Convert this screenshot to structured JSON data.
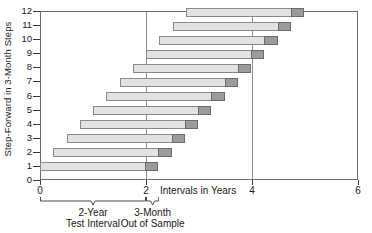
{
  "chart_data": {
    "type": "bar",
    "orientation": "horizontal",
    "title": "",
    "xlabel": "Intervals in Years",
    "ylabel": "Step-Forward in 3-Month Steps",
    "xlim": [
      0,
      6
    ],
    "ylim": [
      0,
      12
    ],
    "xticks": [
      0,
      2,
      4,
      6
    ],
    "xticklabels": [
      "0",
      "2",
      "4",
      "6"
    ],
    "yticks": [
      0,
      1,
      2,
      3,
      4,
      5,
      6,
      7,
      8,
      9,
      10,
      11,
      12
    ],
    "yticklabels": [
      "0",
      "1",
      "2",
      "3",
      "4",
      "5",
      "6",
      "7",
      "8",
      "9",
      "10",
      "11",
      "12"
    ],
    "grid": "vertical-only",
    "gridlines_x": [
      2,
      4
    ],
    "legend": "none",
    "series": [
      {
        "name": "2-Year Test Interval",
        "color": "#e2e2e2",
        "edge_color": "#8a8a8a",
        "length_years": 2.0
      },
      {
        "name": "3-Month Out of Sample",
        "color": "#9b9b9b",
        "edge_color": "#6b6b6b",
        "length_years": 0.25
      }
    ],
    "categories": [
      "1",
      "2",
      "3",
      "4",
      "5",
      "6",
      "7",
      "8",
      "9",
      "10",
      "11",
      "12"
    ],
    "bars": [
      {
        "step": 1,
        "start": 0.0,
        "test_end": 2.0,
        "oos_end": 2.25
      },
      {
        "step": 2,
        "start": 0.25,
        "test_end": 2.25,
        "oos_end": 2.5
      },
      {
        "step": 3,
        "start": 0.5,
        "test_end": 2.5,
        "oos_end": 2.75
      },
      {
        "step": 4,
        "start": 0.75,
        "test_end": 2.75,
        "oos_end": 3.0
      },
      {
        "step": 5,
        "start": 1.0,
        "test_end": 3.0,
        "oos_end": 3.25
      },
      {
        "step": 6,
        "start": 1.25,
        "test_end": 3.25,
        "oos_end": 3.5
      },
      {
        "step": 7,
        "start": 1.5,
        "test_end": 3.5,
        "oos_end": 3.75
      },
      {
        "step": 8,
        "start": 1.75,
        "test_end": 3.75,
        "oos_end": 4.0
      },
      {
        "step": 9,
        "start": 2.0,
        "test_end": 4.0,
        "oos_end": 4.25
      },
      {
        "step": 10,
        "start": 2.25,
        "test_end": 4.25,
        "oos_end": 4.5
      },
      {
        "step": 11,
        "start": 2.5,
        "test_end": 4.5,
        "oos_end": 4.75
      },
      {
        "step": 12,
        "start": 2.75,
        "test_end": 4.75,
        "oos_end": 5.0
      }
    ],
    "annotations": [
      {
        "id": "test-interval",
        "line1": "2-Year",
        "line2": "Test Interval",
        "brace_from": 0.0,
        "brace_to": 2.0
      },
      {
        "id": "out-of-sample",
        "line1": "3-Month",
        "line2": "Out of Sample",
        "brace_from": 2.0,
        "brace_to": 2.25
      }
    ]
  }
}
